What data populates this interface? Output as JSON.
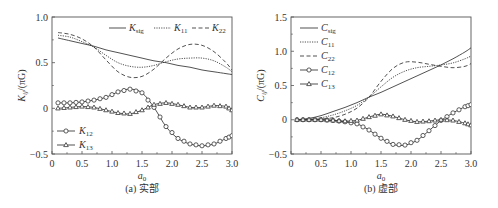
{
  "chart_data": [
    {
      "type": "line",
      "panel": "a",
      "caption": "(a) 实部",
      "xlabel": "a0",
      "ylabel": "Kij/(πG)",
      "xlim": [
        0,
        3.0
      ],
      "ylim": [
        -0.5,
        1.0
      ],
      "xticks": [
        "0",
        "0.5",
        "1.0",
        "1.5",
        "2.0",
        "2.5",
        "3.0"
      ],
      "yticks": [
        "-0.5",
        "0",
        "0.5",
        "1.0"
      ],
      "grid": false,
      "legend": [
        {
          "name": "Ksig",
          "style": "solid",
          "marker": "none"
        },
        {
          "name": "K11",
          "style": "dotted",
          "marker": "none"
        },
        {
          "name": "K22",
          "style": "dashed",
          "marker": "none"
        },
        {
          "name": "K12",
          "style": "solid",
          "marker": "circle"
        },
        {
          "name": "K13",
          "style": "solid",
          "marker": "triangle"
        }
      ],
      "x": [
        0.1,
        0.3,
        0.5,
        0.7,
        0.9,
        1.1,
        1.3,
        1.5,
        1.7,
        1.9,
        2.1,
        2.3,
        2.5,
        2.7,
        2.9,
        3.0
      ],
      "series": [
        {
          "name": "Ksig",
          "values": [
            0.77,
            0.74,
            0.71,
            0.68,
            0.64,
            0.61,
            0.58,
            0.55,
            0.52,
            0.5,
            0.47,
            0.45,
            0.42,
            0.4,
            0.38,
            0.37
          ]
        },
        {
          "name": "K11",
          "values": [
            0.8,
            0.78,
            0.73,
            0.67,
            0.58,
            0.5,
            0.46,
            0.45,
            0.47,
            0.51,
            0.54,
            0.55,
            0.55,
            0.52,
            0.45,
            0.4
          ]
        },
        {
          "name": "K22",
          "values": [
            0.83,
            0.81,
            0.76,
            0.67,
            0.53,
            0.4,
            0.34,
            0.35,
            0.43,
            0.55,
            0.65,
            0.7,
            0.69,
            0.62,
            0.5,
            0.42
          ]
        },
        {
          "name": "K12",
          "values": [
            0.06,
            0.06,
            0.07,
            0.09,
            0.12,
            0.18,
            0.21,
            0.17,
            0.01,
            -0.2,
            -0.33,
            -0.39,
            -0.41,
            -0.39,
            -0.33,
            -0.3
          ]
        },
        {
          "name": "K13",
          "values": [
            0.0,
            0.01,
            0.02,
            0.01,
            -0.02,
            -0.05,
            -0.06,
            -0.02,
            0.04,
            0.06,
            0.04,
            0.01,
            0.01,
            0.03,
            0.02,
            -0.02
          ]
        }
      ]
    },
    {
      "type": "line",
      "panel": "b",
      "caption": "(b) 虚部",
      "xlabel": "a0",
      "ylabel": "Cij/(πG)",
      "xlim": [
        0,
        3.0
      ],
      "ylim": [
        -0.5,
        1.5
      ],
      "xticks": [
        "0",
        "0.5",
        "1.0",
        "1.5",
        "2.0",
        "2.5",
        "3.0"
      ],
      "yticks": [
        "-0.5",
        "0",
        "0.5",
        "1.0",
        "1.5"
      ],
      "grid": false,
      "legend": [
        {
          "name": "Csig",
          "style": "solid",
          "marker": "none"
        },
        {
          "name": "C11",
          "style": "dotted",
          "marker": "none"
        },
        {
          "name": "C22",
          "style": "dashed",
          "marker": "none"
        },
        {
          "name": "C12",
          "style": "solid",
          "marker": "circle"
        },
        {
          "name": "C13",
          "style": "solid",
          "marker": "triangle"
        }
      ],
      "x": [
        0.1,
        0.3,
        0.5,
        0.7,
        0.9,
        1.1,
        1.3,
        1.5,
        1.7,
        1.9,
        2.1,
        2.3,
        2.5,
        2.7,
        2.9,
        3.0
      ],
      "series": [
        {
          "name": "Csig",
          "values": [
            0.0,
            0.02,
            0.06,
            0.12,
            0.18,
            0.25,
            0.33,
            0.4,
            0.48,
            0.56,
            0.64,
            0.72,
            0.8,
            0.89,
            0.99,
            1.05
          ]
        },
        {
          "name": "C11",
          "values": [
            0.0,
            0.01,
            0.03,
            0.07,
            0.13,
            0.21,
            0.33,
            0.48,
            0.62,
            0.71,
            0.76,
            0.78,
            0.8,
            0.83,
            0.89,
            0.93
          ]
        },
        {
          "name": "C22",
          "values": [
            0.0,
            0.0,
            0.01,
            0.03,
            0.08,
            0.17,
            0.33,
            0.56,
            0.75,
            0.84,
            0.84,
            0.81,
            0.78,
            0.76,
            0.78,
            0.82
          ]
        },
        {
          "name": "C12",
          "values": [
            0.0,
            0.0,
            0.0,
            -0.01,
            -0.03,
            -0.06,
            -0.15,
            -0.27,
            -0.36,
            -0.37,
            -0.3,
            -0.16,
            -0.01,
            0.1,
            0.19,
            0.22
          ]
        },
        {
          "name": "C13",
          "values": [
            0.0,
            0.0,
            0.0,
            -0.01,
            -0.02,
            -0.01,
            0.04,
            0.08,
            0.05,
            0.0,
            -0.03,
            -0.02,
            0.0,
            -0.01,
            -0.05,
            -0.08
          ]
        }
      ]
    }
  ]
}
